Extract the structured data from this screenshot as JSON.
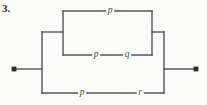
{
  "figure": {
    "number_label": "3.",
    "background_color": "#fbfbfa",
    "line_color": "#55555a",
    "label_color": "#4a4a4f",
    "width": 207,
    "height": 105
  },
  "circuit": {
    "type": "two-terminal-series-parallel-network",
    "terminals": [
      {
        "name": "left-terminal",
        "x": 14,
        "y": 69
      },
      {
        "name": "right-terminal",
        "x": 196,
        "y": 69
      }
    ],
    "branches": [
      {
        "id": "top-branch",
        "y": 11,
        "elements": [
          {
            "label": "p",
            "x": 110
          }
        ]
      },
      {
        "id": "middle-branch",
        "y": 55,
        "elements": [
          {
            "label": "p",
            "x": 96
          },
          {
            "label": "q",
            "x": 127
          }
        ]
      },
      {
        "id": "bottom-branch",
        "y": 93,
        "elements": [
          {
            "label": "p",
            "x": 82
          },
          {
            "label": "r",
            "x": 140
          }
        ]
      }
    ],
    "rails": {
      "outer_left_x": 42,
      "outer_right_x": 164,
      "inner_left_x": 63,
      "inner_right_x": 152,
      "outer_top_y": 32,
      "outer_bottom_y": 93,
      "inner_top_y": 11,
      "inner_bottom_y": 55
    }
  }
}
